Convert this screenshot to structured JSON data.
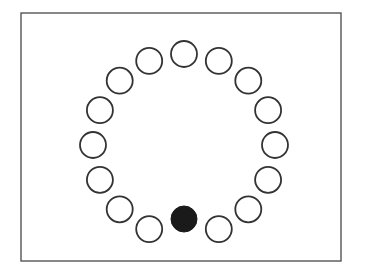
{
  "figure": {
    "title": "",
    "background_color": "#ffffff",
    "frame": {
      "name": "outer-frame",
      "x": 21,
      "y": 13,
      "width": 320,
      "height": 248,
      "stroke_color": "#555555",
      "stroke_width": 1.4,
      "fill_color": "#ffffff"
    }
  },
  "chart_data": {
    "type": "scatter",
    "title": "",
    "subtitle": "",
    "xlabel": "",
    "ylabel": "",
    "xlim": [
      21,
      341
    ],
    "ylim": [
      13,
      261
    ],
    "grid": false,
    "legend": null,
    "annotations": [],
    "layout": {
      "arrangement": "circular-ring",
      "node_count": 16,
      "center_x": 184,
      "center_y": 145,
      "ring_radius": 91,
      "node_radius": 13,
      "angle_step_degrees": 22.5,
      "start_angle_degrees": -90
    },
    "styles": {
      "outline_stroke": "#333333",
      "outline_fill": "#ffffff",
      "outline_stroke_width": 1.8,
      "filled_fill": "#1a1a1a",
      "filled_stroke": "#1a1a1a"
    },
    "categories": [
      "node-1",
      "node-2",
      "node-3",
      "node-4",
      "node-5",
      "node-6",
      "node-7",
      "node-8",
      "node-9",
      "node-10",
      "node-11",
      "node-12",
      "node-13",
      "node-14",
      "node-15",
      "node-16"
    ],
    "values": [
      0,
      0,
      0,
      0,
      0,
      0,
      0,
      0,
      1,
      0,
      0,
      0,
      0,
      0,
      0,
      0
    ],
    "series": [
      {
        "name": "ring-nodes",
        "values": [
          0,
          0,
          0,
          0,
          0,
          0,
          0,
          0,
          1,
          0,
          0,
          0,
          0,
          0,
          0,
          0
        ]
      }
    ],
    "nodes": [
      {
        "index": 0,
        "name": "node-1",
        "angle_degrees": -90,
        "cx": 184,
        "cy": 54,
        "r": 13,
        "state": "empty",
        "fill": "#ffffff"
      },
      {
        "index": 1,
        "name": "node-2",
        "angle_degrees": -67.5,
        "cx": 218.8,
        "cy": 60.9,
        "r": 13,
        "state": "empty",
        "fill": "#ffffff"
      },
      {
        "index": 2,
        "name": "node-3",
        "angle_degrees": -45,
        "cx": 248.3,
        "cy": 80.7,
        "r": 13,
        "state": "empty",
        "fill": "#ffffff"
      },
      {
        "index": 3,
        "name": "node-4",
        "angle_degrees": -22.5,
        "cx": 268.1,
        "cy": 110.2,
        "r": 13,
        "state": "empty",
        "fill": "#ffffff"
      },
      {
        "index": 4,
        "name": "node-5",
        "angle_degrees": 0,
        "cx": 275,
        "cy": 145,
        "r": 13,
        "state": "empty",
        "fill": "#ffffff"
      },
      {
        "index": 5,
        "name": "node-6",
        "angle_degrees": 22.5,
        "cx": 268.1,
        "cy": 179.8,
        "r": 13,
        "state": "empty",
        "fill": "#ffffff"
      },
      {
        "index": 6,
        "name": "node-7",
        "angle_degrees": 45,
        "cx": 248.3,
        "cy": 209.3,
        "r": 13,
        "state": "empty",
        "fill": "#ffffff"
      },
      {
        "index": 7,
        "name": "node-8",
        "angle_degrees": 67.5,
        "cx": 218.8,
        "cy": 229.1,
        "r": 13,
        "state": "empty",
        "fill": "#ffffff"
      },
      {
        "index": 8,
        "name": "node-9",
        "angle_degrees": 90,
        "cx": 184,
        "cy": 219,
        "r": 13,
        "state": "filled",
        "fill": "#1a1a1a"
      },
      {
        "index": 9,
        "name": "node-10",
        "angle_degrees": 112.5,
        "cx": 149.2,
        "cy": 229.1,
        "r": 13,
        "state": "empty",
        "fill": "#ffffff"
      },
      {
        "index": 10,
        "name": "node-11",
        "angle_degrees": 135,
        "cx": 119.7,
        "cy": 209.3,
        "r": 13,
        "state": "empty",
        "fill": "#ffffff"
      },
      {
        "index": 11,
        "name": "node-12",
        "angle_degrees": 157.5,
        "cx": 99.9,
        "cy": 179.8,
        "r": 13,
        "state": "empty",
        "fill": "#ffffff"
      },
      {
        "index": 12,
        "name": "node-13",
        "angle_degrees": 180,
        "cx": 93,
        "cy": 145,
        "r": 13,
        "state": "empty",
        "fill": "#ffffff"
      },
      {
        "index": 13,
        "name": "node-14",
        "angle_degrees": 202.5,
        "cx": 99.9,
        "cy": 110.2,
        "r": 13,
        "state": "empty",
        "fill": "#ffffff"
      },
      {
        "index": 14,
        "name": "node-15",
        "angle_degrees": 225,
        "cx": 119.7,
        "cy": 80.7,
        "r": 13,
        "state": "empty",
        "fill": "#ffffff"
      },
      {
        "index": 15,
        "name": "node-16",
        "angle_degrees": 247.5,
        "cx": 149.2,
        "cy": 60.9,
        "r": 13,
        "state": "empty",
        "fill": "#ffffff"
      }
    ]
  }
}
